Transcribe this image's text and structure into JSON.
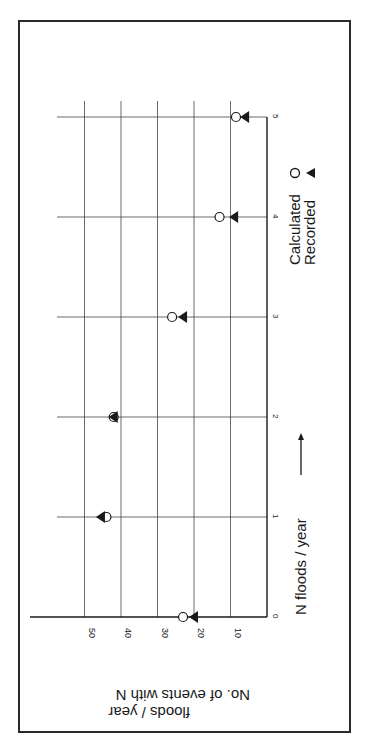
{
  "chart_data": {
    "type": "scatter",
    "orientation": "rotated 90 degrees clockwise (x-axis runs top-to-bottom on page)",
    "title": "",
    "xlabel": "N floods / year",
    "ylabel": "No. of events with N floods / year",
    "x": [
      0,
      1,
      2,
      3,
      4,
      5
    ],
    "x_ticks": [
      "0",
      "1",
      "2",
      "3",
      "4",
      "5"
    ],
    "y_ticks": [
      "10",
      "20",
      "30",
      "40",
      "50"
    ],
    "xlim": [
      0,
      5
    ],
    "ylim": [
      0,
      55
    ],
    "grid": true,
    "legend_position": "right, below x-axis label",
    "series": [
      {
        "name": "Calculated",
        "marker": "open-circle",
        "values": [
          23,
          44,
          42,
          26,
          13,
          8.5
        ]
      },
      {
        "name": "Recorded",
        "marker": "filled-triangle",
        "values": [
          20,
          45.5,
          42,
          23,
          9,
          6
        ]
      }
    ]
  },
  "legend": {
    "items": [
      {
        "label": "Calculated",
        "symbol": "○"
      },
      {
        "label": "Recorded",
        "symbol": "▲"
      }
    ]
  },
  "axis": {
    "xlabel": "N floods / year",
    "xlabel_arrow": "→",
    "ylabel_line1": "No. of events with N",
    "ylabel_line2": "floods / year"
  }
}
